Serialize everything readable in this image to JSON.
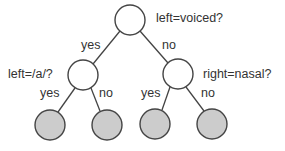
{
  "diagram": {
    "type": "decision-tree",
    "colors": {
      "stroke": "#444444",
      "internal_fill": "#ffffff",
      "leaf_fill": "#cccccc"
    },
    "nodes": [
      {
        "id": "root",
        "question": "left=voiced?",
        "cx": 130,
        "cy": 20,
        "leaf": false
      },
      {
        "id": "left",
        "question": "left=/a/?",
        "cx": 83,
        "cy": 75,
        "leaf": false
      },
      {
        "id": "right",
        "question": "right=nasal?",
        "cx": 178,
        "cy": 74,
        "leaf": false
      },
      {
        "id": "leaf1",
        "cx": 50,
        "cy": 125,
        "leaf": true
      },
      {
        "id": "leaf2",
        "cx": 107,
        "cy": 125,
        "leaf": true
      },
      {
        "id": "leaf3",
        "cx": 155,
        "cy": 124,
        "leaf": true
      },
      {
        "id": "leaf4",
        "cx": 212,
        "cy": 124,
        "leaf": true
      }
    ],
    "edges": [
      {
        "from": "root",
        "to": "left",
        "label": "yes"
      },
      {
        "from": "root",
        "to": "right",
        "label": "no"
      },
      {
        "from": "left",
        "to": "leaf1",
        "label": "yes"
      },
      {
        "from": "left",
        "to": "leaf2",
        "label": "no"
      },
      {
        "from": "right",
        "to": "leaf3",
        "label": "yes"
      },
      {
        "from": "right",
        "to": "leaf4",
        "label": "no"
      }
    ]
  }
}
